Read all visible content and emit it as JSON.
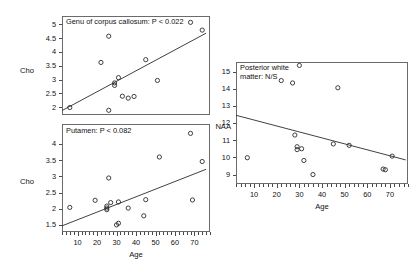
{
  "figure": {
    "panel_count": 3
  },
  "chart_data": [
    {
      "id": "genu",
      "type": "scatter",
      "title": "Genu of corpus callosum: P < 0.022",
      "xlabel": "Age",
      "ylabel": "Cho",
      "xlim": [
        2,
        78
      ],
      "ylim": [
        1.72,
        5.3
      ],
      "xticks": [
        10,
        20,
        30,
        40,
        50,
        60,
        70
      ],
      "yticks": [
        2,
        2.5,
        3,
        3.5,
        4,
        4.5,
        5
      ],
      "grid": false,
      "legend": null,
      "points": [
        {
          "x": 6,
          "y": 1.99
        },
        {
          "x": 22,
          "y": 3.62
        },
        {
          "x": 26,
          "y": 4.57
        },
        {
          "x": 26,
          "y": 1.89
        },
        {
          "x": 29,
          "y": 2.88
        },
        {
          "x": 29,
          "y": 2.79
        },
        {
          "x": 31,
          "y": 3.07
        },
        {
          "x": 33,
          "y": 2.4
        },
        {
          "x": 36,
          "y": 2.33
        },
        {
          "x": 39,
          "y": 2.39
        },
        {
          "x": 45,
          "y": 3.72
        },
        {
          "x": 51,
          "y": 2.97
        },
        {
          "x": 68,
          "y": 5.07
        },
        {
          "x": 74,
          "y": 4.79
        }
      ],
      "fit_line": {
        "x1": 2,
        "y1": 1.88,
        "x2": 76,
        "y2": 4.68
      }
    },
    {
      "id": "putamen",
      "type": "scatter",
      "title": "Putamen: P < 0.082",
      "xlabel": "Age",
      "ylabel": "Cho",
      "xlim": [
        2,
        78
      ],
      "ylim": [
        1.28,
        4.62
      ],
      "xticks": [
        10,
        20,
        30,
        40,
        50,
        60,
        70
      ],
      "yticks": [
        1.5,
        2,
        2.5,
        3,
        3.5,
        4
      ],
      "grid": false,
      "legend": null,
      "points": [
        {
          "x": 6,
          "y": 2.04
        },
        {
          "x": 19,
          "y": 2.26
        },
        {
          "x": 25,
          "y": 2.08
        },
        {
          "x": 25,
          "y": 2.02
        },
        {
          "x": 25,
          "y": 1.97
        },
        {
          "x": 26,
          "y": 2.95
        },
        {
          "x": 27,
          "y": 2.19
        },
        {
          "x": 30,
          "y": 1.5
        },
        {
          "x": 31,
          "y": 1.55
        },
        {
          "x": 31,
          "y": 2.21
        },
        {
          "x": 36,
          "y": 2.02
        },
        {
          "x": 44,
          "y": 1.78
        },
        {
          "x": 45,
          "y": 2.28
        },
        {
          "x": 52,
          "y": 3.6
        },
        {
          "x": 68,
          "y": 4.33
        },
        {
          "x": 69,
          "y": 2.27
        },
        {
          "x": 74,
          "y": 3.46
        }
      ],
      "fit_line": {
        "x1": 2,
        "y1": 1.47,
        "x2": 76,
        "y2": 3.22
      }
    },
    {
      "id": "posterior-white-matter",
      "type": "scatter",
      "title": "Posterior white\nmatter: N/S",
      "xlabel": "Age",
      "ylabel": "NAA",
      "xlim": [
        2,
        78
      ],
      "ylim": [
        8.45,
        15.55
      ],
      "xticks": [
        10,
        20,
        30,
        40,
        50,
        60,
        70
      ],
      "yticks": [
        9,
        10,
        11,
        12,
        13,
        14,
        15
      ],
      "grid": false,
      "legend": null,
      "points": [
        {
          "x": 7,
          "y": 9.98
        },
        {
          "x": 22,
          "y": 14.47
        },
        {
          "x": 27,
          "y": 14.33
        },
        {
          "x": 30,
          "y": 15.35
        },
        {
          "x": 28,
          "y": 11.3
        },
        {
          "x": 29,
          "y": 10.62
        },
        {
          "x": 29,
          "y": 10.45
        },
        {
          "x": 31,
          "y": 10.5
        },
        {
          "x": 32,
          "y": 9.82
        },
        {
          "x": 36,
          "y": 9.0
        },
        {
          "x": 47,
          "y": 14.05
        },
        {
          "x": 45,
          "y": 10.78
        },
        {
          "x": 52,
          "y": 10.7
        },
        {
          "x": 67,
          "y": 9.32
        },
        {
          "x": 68,
          "y": 9.28
        },
        {
          "x": 71,
          "y": 10.07
        }
      ],
      "fit_line": {
        "x1": 2,
        "y1": 12.45,
        "x2": 77,
        "y2": 9.85
      }
    }
  ]
}
